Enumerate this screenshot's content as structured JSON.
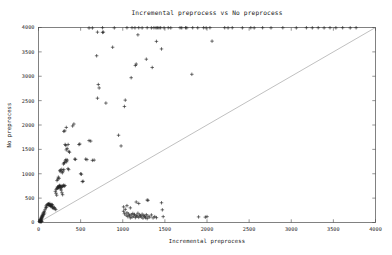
{
  "chart_data": {
    "type": "scatter",
    "title": "Incremental preprocess vs No preprocess",
    "xlabel": "Incremental preprocess",
    "ylabel": "No preprocess",
    "xlim": [
      0,
      4000
    ],
    "ylim": [
      0,
      4000
    ],
    "grid": false,
    "legend": "none",
    "marker": "plus",
    "marker_color": "#202020",
    "reference_line": {
      "name": "y = x diagonal",
      "from": [
        0,
        0
      ],
      "to": [
        4000,
        4000
      ],
      "color": "#8c8c8c"
    },
    "xticks": [
      0,
      500,
      1000,
      1500,
      2000,
      2500,
      3000,
      3500,
      4000
    ],
    "yticks": [
      0,
      500,
      1000,
      1500,
      2000,
      2500,
      3000,
      3500,
      4000
    ],
    "xticklabels": [
      "0",
      "500",
      "1000",
      "1500",
      "2000",
      "2500",
      "3000",
      "3500",
      "4000"
    ],
    "yticklabels": [
      "0",
      "500",
      "1000",
      "1500",
      "2000",
      "2500",
      "3000",
      "3500",
      "4000"
    ],
    "series": [
      {
        "name": "runs",
        "points": [
          [
            10,
            20
          ],
          [
            15,
            35
          ],
          [
            18,
            55
          ],
          [
            22,
            30
          ],
          [
            25,
            70
          ],
          [
            28,
            45
          ],
          [
            30,
            90
          ],
          [
            32,
            60
          ],
          [
            35,
            110
          ],
          [
            38,
            80
          ],
          [
            40,
            130
          ],
          [
            42,
            100
          ],
          [
            20,
            15
          ],
          [
            24,
            25
          ],
          [
            30,
            40
          ],
          [
            45,
            150
          ],
          [
            48,
            120
          ],
          [
            52,
            175
          ],
          [
            55,
            140
          ],
          [
            58,
            200
          ],
          [
            62,
            165
          ],
          [
            30,
            15
          ],
          [
            35,
            20
          ],
          [
            40,
            25
          ],
          [
            68,
            230
          ],
          [
            72,
            195
          ],
          [
            78,
            260
          ],
          [
            85,
            300
          ],
          [
            90,
            340
          ],
          [
            95,
            310
          ],
          [
            100,
            360
          ],
          [
            108,
            375
          ],
          [
            115,
            355
          ],
          [
            120,
            380
          ],
          [
            128,
            365
          ],
          [
            135,
            390
          ],
          [
            142,
            345
          ],
          [
            150,
            330
          ],
          [
            158,
            370
          ],
          [
            165,
            300
          ],
          [
            172,
            320
          ],
          [
            180,
            290
          ],
          [
            188,
            310
          ],
          [
            196,
            280
          ],
          [
            205,
            265
          ],
          [
            140,
            345
          ],
          [
            148,
            355
          ],
          [
            156,
            338
          ],
          [
            164,
            362
          ],
          [
            118,
            378
          ],
          [
            126,
            368
          ],
          [
            134,
            352
          ],
          [
            210,
            680
          ],
          [
            218,
            700
          ],
          [
            226,
            730
          ],
          [
            234,
            715
          ],
          [
            242,
            745
          ],
          [
            250,
            760
          ],
          [
            258,
            735
          ],
          [
            266,
            755
          ],
          [
            274,
            720
          ],
          [
            282,
            740
          ],
          [
            290,
            750
          ],
          [
            298,
            765
          ],
          [
            306,
            745
          ],
          [
            314,
            758
          ],
          [
            230,
            705
          ],
          [
            238,
            725
          ],
          [
            246,
            742
          ],
          [
            254,
            718
          ],
          [
            262,
            690
          ],
          [
            270,
            665
          ],
          [
            278,
            610
          ],
          [
            286,
            570
          ],
          [
            200,
            640
          ],
          [
            208,
            600
          ],
          [
            216,
            560
          ],
          [
            220,
            860
          ],
          [
            228,
            890
          ],
          [
            236,
            930
          ],
          [
            244,
            905
          ],
          [
            252,
            1060
          ],
          [
            260,
            1075
          ],
          [
            268,
            1040
          ],
          [
            276,
            1090
          ],
          [
            284,
            1020
          ],
          [
            292,
            1055
          ],
          [
            300,
            1085
          ],
          [
            310,
            1230
          ],
          [
            318,
            1265
          ],
          [
            326,
            1290
          ],
          [
            334,
            1245
          ],
          [
            342,
            1280
          ],
          [
            350,
            1105
          ],
          [
            358,
            1085
          ],
          [
            296,
            1200
          ],
          [
            304,
            1220
          ],
          [
            330,
            1490
          ],
          [
            340,
            1520
          ],
          [
            352,
            1600
          ],
          [
            360,
            1460
          ],
          [
            368,
            1440
          ],
          [
            316,
            1600
          ],
          [
            324,
            1580
          ],
          [
            300,
            1870
          ],
          [
            312,
            1880
          ],
          [
            330,
            1950
          ],
          [
            420,
            2020
          ],
          [
            405,
            1980
          ],
          [
            430,
            1300
          ],
          [
            440,
            1295
          ],
          [
            480,
            1600
          ],
          [
            490,
            1610
          ],
          [
            500,
            1000
          ],
          [
            510,
            990
          ],
          [
            520,
            840
          ],
          [
            530,
            845
          ],
          [
            560,
            1300
          ],
          [
            575,
            1290
          ],
          [
            600,
            1680
          ],
          [
            620,
            1670
          ],
          [
            640,
            1275
          ],
          [
            660,
            1280
          ],
          [
            700,
            2550
          ],
          [
            710,
            2830
          ],
          [
            720,
            2760
          ],
          [
            690,
            3420
          ],
          [
            700,
            3905
          ],
          [
            760,
            3900
          ],
          [
            770,
            3905
          ],
          [
            800,
            2450
          ],
          [
            880,
            3595
          ],
          [
            950,
            1790
          ],
          [
            980,
            1570
          ],
          [
            1020,
            2380
          ],
          [
            1030,
            2510
          ],
          [
            1100,
            2970
          ],
          [
            1150,
            3220
          ],
          [
            1160,
            3250
          ],
          [
            1180,
            3850
          ],
          [
            1280,
            3350
          ],
          [
            1350,
            3180
          ],
          [
            1400,
            3715
          ],
          [
            1460,
            3560
          ],
          [
            1820,
            3040
          ],
          [
            2060,
            3720
          ],
          [
            1010,
            230
          ],
          [
            1020,
            180
          ],
          [
            1030,
            270
          ],
          [
            1040,
            150
          ],
          [
            1050,
            200
          ],
          [
            1060,
            120
          ],
          [
            1070,
            175
          ],
          [
            1080,
            140
          ],
          [
            1090,
            95
          ],
          [
            1100,
            160
          ],
          [
            1110,
            110
          ],
          [
            1120,
            185
          ],
          [
            1130,
            130
          ],
          [
            1140,
            165
          ],
          [
            1150,
            100
          ],
          [
            1160,
            145
          ],
          [
            1170,
            125
          ],
          [
            1180,
            190
          ],
          [
            1190,
            105
          ],
          [
            1200,
            155
          ],
          [
            1210,
            135
          ],
          [
            1220,
            115
          ],
          [
            1230,
            170
          ],
          [
            1240,
            90
          ],
          [
            1250,
            145
          ],
          [
            1260,
            125
          ],
          [
            1270,
            100
          ],
          [
            1280,
            160
          ],
          [
            1290,
            80
          ],
          [
            1300,
            130
          ],
          [
            1320,
            110
          ],
          [
            1340,
            155
          ],
          [
            1360,
            95
          ],
          [
            1380,
            120
          ],
          [
            1400,
            100
          ],
          [
            1010,
            320
          ],
          [
            1050,
            345
          ],
          [
            1090,
            300
          ],
          [
            1160,
            420
          ],
          [
            1190,
            390
          ],
          [
            1290,
            460
          ],
          [
            1300,
            455
          ],
          [
            1460,
            405
          ],
          [
            1470,
            260
          ],
          [
            1480,
            120
          ],
          [
            1900,
            115
          ],
          [
            1980,
            110
          ],
          [
            2000,
            120
          ],
          [
            600,
            3990
          ],
          [
            640,
            3990
          ],
          [
            760,
            3995
          ],
          [
            900,
            3992
          ],
          [
            1050,
            3995
          ],
          [
            1110,
            3995
          ],
          [
            1145,
            3993
          ],
          [
            1190,
            3995
          ],
          [
            1230,
            3992
          ],
          [
            1290,
            3995
          ],
          [
            1340,
            3992
          ],
          [
            1370,
            3995
          ],
          [
            1395,
            3993
          ],
          [
            1410,
            3995
          ],
          [
            1430,
            3992
          ],
          [
            1450,
            3995
          ],
          [
            1490,
            3993
          ],
          [
            1540,
            3995
          ],
          [
            1570,
            3992
          ],
          [
            1680,
            3995
          ],
          [
            1700,
            3993
          ],
          [
            1745,
            3995
          ],
          [
            1760,
            3992
          ],
          [
            1830,
            3995
          ],
          [
            1890,
            3993
          ],
          [
            1960,
            3995
          ],
          [
            1990,
            3992
          ],
          [
            2035,
            3995
          ],
          [
            2210,
            3995
          ],
          [
            2250,
            3992
          ],
          [
            2300,
            3995
          ],
          [
            2420,
            3993
          ],
          [
            2520,
            3995
          ],
          [
            2560,
            3992
          ],
          [
            2660,
            3995
          ],
          [
            2760,
            3993
          ],
          [
            2900,
            3995
          ],
          [
            3060,
            3992
          ],
          [
            3180,
            3995
          ],
          [
            3250,
            3993
          ],
          [
            3320,
            3995
          ],
          [
            3390,
            3992
          ],
          [
            3460,
            3995
          ],
          [
            3530,
            3993
          ],
          [
            3610,
            3995
          ],
          [
            3700,
            3992
          ],
          [
            3770,
            3995
          ]
        ]
      }
    ]
  }
}
